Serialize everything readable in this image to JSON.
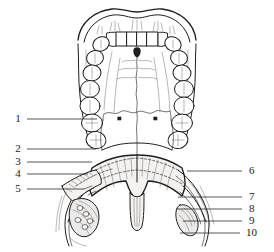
{
  "figure": {
    "title": "Oral cavity viewed from below: hard palate, soft palate and fauces",
    "view": "inferior view",
    "style": "black and white pen-and-ink line art",
    "background_color": "#ffffff",
    "ink_color": "#1d1d1d"
  },
  "labels": {
    "left": [
      {
        "number": "1",
        "x": 18,
        "y": 122,
        "line_from_x": 27,
        "line_to_x": 97,
        "line_y": 119
      },
      {
        "number": "2",
        "x": 18,
        "y": 152,
        "line_from_x": 27,
        "line_to_x": 96,
        "line_y": 149
      },
      {
        "number": "3",
        "x": 18,
        "y": 165,
        "line_from_x": 27,
        "line_to_x": 92,
        "line_y": 162
      },
      {
        "number": "4",
        "x": 18,
        "y": 177,
        "line_from_x": 27,
        "line_to_x": 88,
        "line_y": 174
      },
      {
        "number": "5",
        "x": 18,
        "y": 192,
        "line_from_x": 27,
        "line_to_x": 84,
        "line_y": 189
      }
    ],
    "right": [
      {
        "number": "6",
        "x": 249,
        "y": 174,
        "line_from_x": 187,
        "line_to_x": 242,
        "line_y": 171
      },
      {
        "number": "7",
        "x": 249,
        "y": 200,
        "line_from_x": 178,
        "line_to_x": 242,
        "line_y": 197
      },
      {
        "number": "8",
        "x": 249,
        "y": 212,
        "line_from_x": 176,
        "line_to_x": 242,
        "line_y": 209
      },
      {
        "number": "9",
        "x": 249,
        "y": 224,
        "line_from_x": 183,
        "line_to_x": 242,
        "line_y": 221
      },
      {
        "number": "10",
        "x": 246,
        "y": 236,
        "line_from_x": 180,
        "line_to_x": 240,
        "line_y": 233
      }
    ]
  },
  "structures": {
    "upper_lip": "upper lip with cupid's bow",
    "incisors": "four maxillary incisors",
    "dental_arch": "maxillary dental arch of canines, premolars and molars",
    "incisive_papilla": "incisive papilla",
    "median_raphe": "median palatine raphe",
    "hard_palate": "hard palate with transverse rugae",
    "soft_palate": "soft palate (velum)",
    "uvula": "uvula",
    "palatoglossal_arch": "palatoglossal arch",
    "palatopharyngeal_arch": "palatopharyngeal arch",
    "palatine_tonsil": "palatine tonsil",
    "pharyngeal_wall": "posterior pharyngeal wall",
    "dissected_side": "left side dissected showing palatal muscles"
  }
}
